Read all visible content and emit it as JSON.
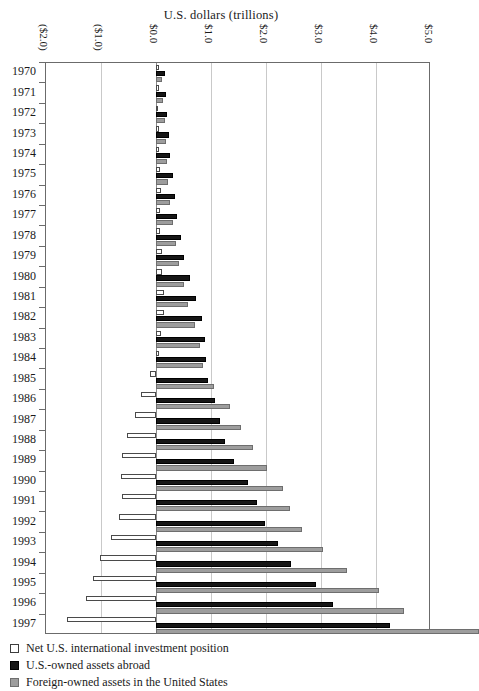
{
  "title": "U.S. dollars (trillions)",
  "axis": {
    "x_ticks": [
      "($2.0)",
      "($1.0)",
      "$0.0",
      "$1.0",
      "$2.0",
      "$3.0",
      "$4.0",
      "$5.0"
    ],
    "x_values": [
      -2.0,
      -1.0,
      0.0,
      1.0,
      2.0,
      3.0,
      4.0,
      5.0
    ]
  },
  "legend": {
    "items": [
      {
        "label": "Net U.S. international investment position",
        "swatch": "net-swatch"
      },
      {
        "label": "U.S.-owned assets abroad",
        "swatch": "assets-swatch"
      },
      {
        "label": "Foreign-owned assets in the United States",
        "swatch": "liabilities-swatch"
      }
    ]
  },
  "colors": {
    "net": "#ffffff",
    "assets": "#161616",
    "liabilities": "#9d9d9d",
    "grid": "#c9c9c9",
    "frame": "#6b6b6b"
  },
  "chart_data": {
    "type": "bar",
    "orientation": "horizontal",
    "title": "U.S. dollars (trillions)",
    "xlabel": "U.S. dollars (trillions)",
    "ylabel": "",
    "xlim": [
      -2.0,
      5.0
    ],
    "grid": true,
    "legend_position": "bottom-left",
    "categories": [
      "1970",
      "1971",
      "1972",
      "1973",
      "1974",
      "1975",
      "1976",
      "1977",
      "1978",
      "1979",
      "1980",
      "1981",
      "1982",
      "1983",
      "1984",
      "1985",
      "1986",
      "1987",
      "1988",
      "1989",
      "1990",
      "1991",
      "1992",
      "1993",
      "1994",
      "1995",
      "1996",
      "1997"
    ],
    "series": [
      {
        "name": "Net U.S. international investment position",
        "values": [
          0.06,
          0.05,
          0.04,
          0.05,
          0.06,
          0.08,
          0.09,
          0.08,
          0.08,
          0.1,
          0.11,
          0.14,
          0.14,
          0.09,
          0.05,
          -0.11,
          -0.27,
          -0.38,
          -0.52,
          -0.61,
          -0.63,
          -0.61,
          -0.68,
          -0.81,
          -1.02,
          -1.15,
          -1.28,
          -1.62
        ]
      },
      {
        "name": "U.S.-owned assets abroad",
        "values": [
          0.17,
          0.18,
          0.2,
          0.23,
          0.26,
          0.3,
          0.35,
          0.38,
          0.45,
          0.51,
          0.61,
          0.72,
          0.84,
          0.89,
          0.9,
          0.95,
          1.07,
          1.17,
          1.25,
          1.41,
          1.68,
          1.83,
          1.98,
          2.22,
          2.46,
          2.9,
          3.22,
          4.25
        ]
      },
      {
        "name": "Foreign-owned assets in the United States",
        "values": [
          0.11,
          0.13,
          0.16,
          0.18,
          0.2,
          0.22,
          0.26,
          0.3,
          0.37,
          0.41,
          0.5,
          0.58,
          0.7,
          0.8,
          0.85,
          1.06,
          1.34,
          1.55,
          1.77,
          2.02,
          2.31,
          2.44,
          2.66,
          3.03,
          3.48,
          4.05,
          4.5,
          5.87
        ]
      }
    ]
  }
}
